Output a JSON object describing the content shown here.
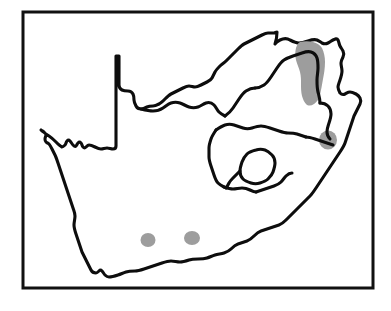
{
  "figure": {
    "name": "south-africa-distribution-map",
    "title": "",
    "caption": "",
    "width": 391,
    "height": 311,
    "background_color": "#ffffff"
  },
  "frame": {
    "name": "map-border-frame",
    "x": 23,
    "y": 12,
    "width": 350,
    "height": 276,
    "stroke_color": "#111111",
    "stroke_width": 3,
    "fill": "none"
  },
  "map": {
    "region_name": "South Africa",
    "outline_color": "#0d0d0d",
    "outline_width": 3.1,
    "land_fill": "#ffffff",
    "features": [
      {
        "name": "country-outline",
        "label": "South Africa national boundary and coastline",
        "type": "outline"
      },
      {
        "name": "province-borders",
        "label": "Internal provincial boundaries",
        "type": "borders"
      },
      {
        "name": "lesotho-enclave",
        "label": "Lesotho enclave boundary",
        "type": "enclave"
      }
    ]
  },
  "legend": {
    "shading_label": "Distribution / occurrence area",
    "shading_color": "#9d9d9d"
  },
  "distribution": {
    "patch_color": "#9d9d9d",
    "patch_count": 4,
    "patches": [
      {
        "name": "patch-northeast-escarpment",
        "label": "North-eastern escarpment belt",
        "cx": 310,
        "cy": 78,
        "approx_area": "large elongated north-south band"
      },
      {
        "name": "patch-kwazulu-natal-north",
        "label": "Northern KwaZulu-Natal locality",
        "cx": 328,
        "cy": 140,
        "approx_area": "small rounded blob"
      },
      {
        "name": "patch-western-cape",
        "label": "Western Cape locality",
        "cx": 148,
        "cy": 240,
        "approx_area": "small rounded blob"
      },
      {
        "name": "patch-southern-cape",
        "label": "Southern Cape locality",
        "cx": 192,
        "cy": 238,
        "approx_area": "small rounded blob"
      }
    ]
  }
}
